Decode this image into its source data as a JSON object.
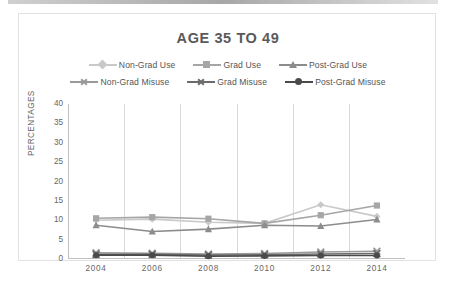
{
  "chart_data": {
    "type": "line",
    "title": "AGE 35 TO 49",
    "xlabel": "",
    "ylabel": "PERCENTAGES",
    "categories": [
      "2004",
      "2006",
      "2008",
      "2010",
      "2012",
      "2014"
    ],
    "x": [
      2004,
      2006,
      2008,
      2010,
      2012,
      2014
    ],
    "ylim": [
      0,
      40
    ],
    "yticks": [
      0,
      5,
      10,
      15,
      20,
      25,
      30,
      35,
      40
    ],
    "grid": "vertical",
    "legend_position": "top",
    "series": [
      {
        "name": "Non-Grad Use",
        "values": [
          10.0,
          10.3,
          9.5,
          9.2,
          14.0,
          11.0
        ],
        "color": "#c9c9c9",
        "marker": "diamond"
      },
      {
        "name": "Grad Use",
        "values": [
          10.5,
          10.8,
          10.4,
          9.2,
          11.3,
          13.8
        ],
        "color": "#a6a6a6",
        "marker": "square"
      },
      {
        "name": "Post-Grad Use",
        "values": [
          8.7,
          7.1,
          7.7,
          8.7,
          8.5,
          10.2
        ],
        "color": "#8c8c8c",
        "marker": "triangle"
      },
      {
        "name": "Non-Grad Misuse",
        "values": [
          1.6,
          1.5,
          1.3,
          1.4,
          1.8,
          2.0
        ],
        "color": "#9a9a9a",
        "marker": "x"
      },
      {
        "name": "Grad Misuse",
        "values": [
          1.2,
          1.2,
          1.0,
          1.1,
          1.3,
          1.4
        ],
        "color": "#6b6b6b",
        "marker": "x"
      },
      {
        "name": "Post-Grad Misuse",
        "values": [
          1.0,
          1.0,
          0.7,
          0.8,
          0.9,
          0.9
        ],
        "color": "#4a4a4a",
        "marker": "circle"
      }
    ]
  },
  "legend": {
    "rows": [
      [
        "Non-Grad Use",
        "Grad Use",
        "Post-Grad Use"
      ],
      [
        "Non-Grad Misuse",
        "Grad Misuse",
        "Post-Grad Misuse"
      ]
    ]
  },
  "axis": {
    "y_title": "PERCENTAGES",
    "y_labels": [
      "40",
      "35",
      "30",
      "25",
      "20",
      "15",
      "10",
      "5",
      "0"
    ],
    "x_labels": [
      "2004",
      "2006",
      "2008",
      "2010",
      "2012",
      "2014"
    ]
  },
  "colors": {
    "title": "#5a5a5a",
    "axis": "#bfbfbf",
    "grid": "#d9d9d9",
    "text": "#666666",
    "frame": "#e2e2e2",
    "background": "#ffffff"
  }
}
